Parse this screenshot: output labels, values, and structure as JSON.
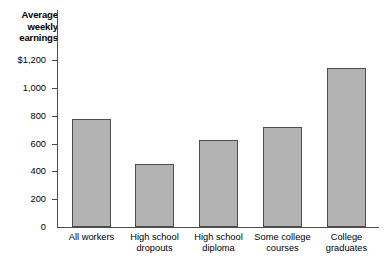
{
  "chart_data": {
    "type": "bar",
    "title": "",
    "ylabel": "Average weekly earnings",
    "xlabel": "",
    "categories": [
      "All workers",
      "High school dropouts",
      "High school diploma",
      "Some college courses",
      "College graduates"
    ],
    "category_lines": [
      [
        "All workers"
      ],
      [
        "High school",
        "dropouts"
      ],
      [
        "High school",
        "diploma"
      ],
      [
        "Some college",
        "courses"
      ],
      [
        "College",
        "graduates"
      ]
    ],
    "values": [
      775,
      455,
      625,
      720,
      1140
    ],
    "ylim": [
      0,
      1200
    ],
    "yticks": [
      0,
      200,
      400,
      600,
      800,
      1000,
      1200
    ],
    "ytick_labels": [
      "0",
      "200",
      "400",
      "600",
      "800",
      "1,000",
      "$1,200"
    ],
    "grid": false,
    "legend": false,
    "bar_color": "#b3b3b3",
    "bar_border_color": "#4d4d4d",
    "axis_color": "#4d4d4d"
  }
}
